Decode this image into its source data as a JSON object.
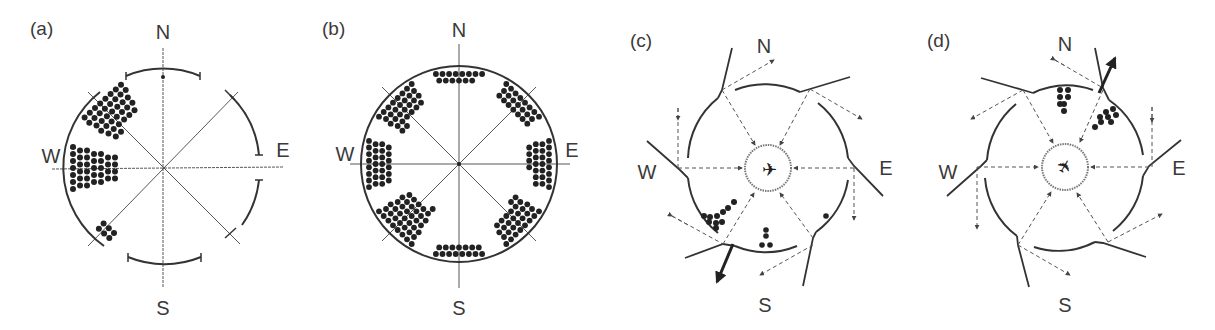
{
  "figure": {
    "panels": [
      {
        "id": "a",
        "label": "(a)",
        "directions": {
          "n": "N",
          "e": "E",
          "s": "S",
          "w": "W"
        },
        "dot_groups": [
          {
            "sector": "NW",
            "count": 38
          },
          {
            "sector": "W",
            "count": 37
          },
          {
            "sector": "SW",
            "count": 6
          },
          {
            "sector": "N",
            "count": 1
          }
        ]
      },
      {
        "id": "b",
        "label": "(b)",
        "directions": {
          "n": "N",
          "e": "E",
          "s": "S",
          "w": "W"
        },
        "dot_groups": [
          {
            "sector": "N",
            "count": 14
          },
          {
            "sector": "NE",
            "count": 22
          },
          {
            "sector": "E",
            "count": 26
          },
          {
            "sector": "SE",
            "count": 30
          },
          {
            "sector": "S",
            "count": 15
          },
          {
            "sector": "SW",
            "count": 40
          },
          {
            "sector": "W",
            "count": 28
          },
          {
            "sector": "NW",
            "count": 30
          }
        ]
      },
      {
        "id": "c",
        "label": "(c)",
        "directions": {
          "n": "N",
          "e": "E",
          "s": "S",
          "w": "W"
        },
        "dot_groups": [
          {
            "sector": "SW",
            "count": 10
          },
          {
            "sector": "S",
            "count": 4
          },
          {
            "sector": "SE",
            "count": 1
          }
        ],
        "highlighted_mirror": "SSW"
      },
      {
        "id": "d",
        "label": "(d)",
        "directions": {
          "n": "N",
          "e": "E",
          "s": "S",
          "w": "W"
        },
        "dot_groups": [
          {
            "sector": "N",
            "count": 7
          },
          {
            "sector": "NNE",
            "count": 8
          }
        ],
        "highlighted_mirror": "NNE"
      }
    ]
  },
  "chart_data": [
    {
      "type": "scatter",
      "title": "(a)",
      "legend": "dots = individual bird headings",
      "sectors": [
        "N",
        "NE",
        "E",
        "SE",
        "S",
        "SW",
        "W",
        "NW"
      ],
      "values": [
        1,
        0,
        0,
        0,
        0,
        6,
        37,
        38
      ]
    },
    {
      "type": "scatter",
      "title": "(b)",
      "sectors": [
        "N",
        "NE",
        "E",
        "SE",
        "S",
        "SW",
        "W",
        "NW"
      ],
      "values": [
        14,
        22,
        26,
        30,
        15,
        40,
        28,
        30
      ]
    },
    {
      "type": "scatter",
      "title": "(c)",
      "sectors": [
        "N",
        "NE",
        "E",
        "SE",
        "S",
        "SW",
        "W",
        "NW"
      ],
      "values": [
        0,
        0,
        0,
        1,
        4,
        10,
        0,
        0
      ]
    },
    {
      "type": "scatter",
      "title": "(d)",
      "sectors": [
        "N",
        "NE",
        "E",
        "SE",
        "S",
        "SW",
        "W",
        "NW"
      ],
      "values": [
        7,
        8,
        0,
        0,
        0,
        0,
        0,
        0
      ]
    }
  ]
}
